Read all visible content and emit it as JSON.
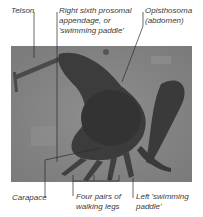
{
  "figure": {
    "labels": {
      "telson": "Telson",
      "right_paddle": "Right sixth prosomal\nappendage, or\n'swimming paddle'",
      "opisthosoma": "Opisthosoma\n(abdomen)",
      "carapace": "Carapace",
      "walking_legs": "Four pairs of\nwalking legs",
      "left_paddle": "Left 'swimming\npaddle'"
    },
    "colors": {
      "background": "#ffffff",
      "label_text": "#3a3a3a",
      "leader_line": "#2a2a2a",
      "photo_base": "#8a8a8a"
    }
  }
}
